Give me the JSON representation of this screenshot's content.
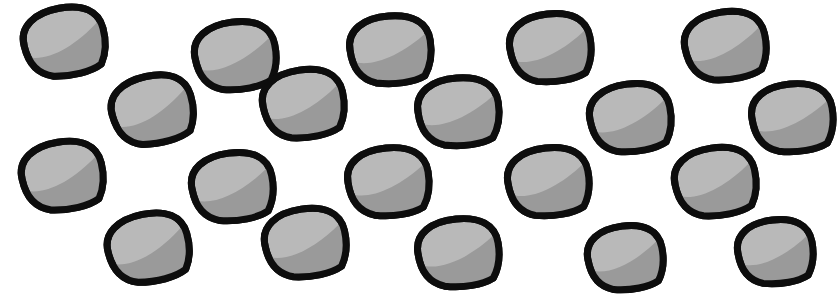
{
  "image": {
    "title": "Seed shapes pattern",
    "width": 837,
    "height": 302,
    "background_color": "#ffffff",
    "object_count": 20,
    "row_count": 4,
    "columns_per_row": 5,
    "arrangement": "staggered grid"
  },
  "shape_style": {
    "name": "seed",
    "outline_color": "#0d0d0d",
    "outline_width": 7,
    "fill_light": "#b9b9b9",
    "fill_shadow": "#9a9a9a",
    "description": "teardrop / seed with pointed lower-right tip, light gray body and darker gray crescent shading along the lower-right"
  },
  "chart_data": {
    "type": "scatter",
    "xlabel": "",
    "ylabel": "",
    "xlim": [
      0,
      837
    ],
    "ylim": [
      0,
      302
    ],
    "grid": false,
    "legend": null,
    "series": [
      {
        "name": "seeds",
        "marker": "seed",
        "points": [
          {
            "id": "seed-r1-c1",
            "row": 1,
            "col": 1,
            "x": 64,
            "y": 42,
            "rx": 41,
            "ry": 34,
            "rotate": -12
          },
          {
            "id": "seed-r1-c2",
            "row": 1,
            "col": 2,
            "x": 235,
            "y": 56,
            "rx": 41,
            "ry": 34,
            "rotate": -9
          },
          {
            "id": "seed-r1-c3",
            "row": 1,
            "col": 3,
            "x": 390,
            "y": 50,
            "rx": 41,
            "ry": 34,
            "rotate": -6
          },
          {
            "id": "seed-r1-c4",
            "row": 1,
            "col": 4,
            "x": 550,
            "y": 48,
            "rx": 41,
            "ry": 34,
            "rotate": -8
          },
          {
            "id": "seed-r1-c5",
            "row": 1,
            "col": 5,
            "x": 725,
            "y": 46,
            "rx": 41,
            "ry": 34,
            "rotate": -10
          }
        ]
      },
      {
        "name": "seeds-row2",
        "marker": "seed",
        "points": [
          {
            "id": "seed-r2-c1",
            "row": 2,
            "col": 1,
            "x": 152,
            "y": 110,
            "rx": 41,
            "ry": 34,
            "rotate": -14
          },
          {
            "id": "seed-r2-c2",
            "row": 2,
            "col": 2,
            "x": 303,
            "y": 104,
            "rx": 41,
            "ry": 34,
            "rotate": -10
          },
          {
            "id": "seed-r2-c3",
            "row": 2,
            "col": 3,
            "x": 458,
            "y": 112,
            "rx": 41,
            "ry": 34,
            "rotate": -6
          },
          {
            "id": "seed-r2-c4",
            "row": 2,
            "col": 4,
            "x": 630,
            "y": 118,
            "rx": 41,
            "ry": 34,
            "rotate": -9
          },
          {
            "id": "seed-r2-c5",
            "row": 2,
            "col": 5,
            "x": 792,
            "y": 118,
            "rx": 41,
            "ry": 34,
            "rotate": -7
          }
        ]
      },
      {
        "name": "seeds-row3",
        "marker": "seed",
        "points": [
          {
            "id": "seed-r3-c1",
            "row": 3,
            "col": 1,
            "x": 62,
            "y": 176,
            "rx": 41,
            "ry": 34,
            "rotate": -11
          },
          {
            "id": "seed-r3-c2",
            "row": 3,
            "col": 2,
            "x": 232,
            "y": 187,
            "rx": 41,
            "ry": 34,
            "rotate": -9
          },
          {
            "id": "seed-r3-c3",
            "row": 3,
            "col": 3,
            "x": 388,
            "y": 182,
            "rx": 41,
            "ry": 34,
            "rotate": -7
          },
          {
            "id": "seed-r3-c4",
            "row": 3,
            "col": 4,
            "x": 548,
            "y": 182,
            "rx": 41,
            "ry": 34,
            "rotate": -8
          },
          {
            "id": "seed-r3-c5",
            "row": 3,
            "col": 5,
            "x": 715,
            "y": 182,
            "rx": 41,
            "ry": 34,
            "rotate": -10
          }
        ]
      },
      {
        "name": "seeds-row4",
        "marker": "seed",
        "points": [
          {
            "id": "seed-r4-c1",
            "row": 4,
            "col": 1,
            "x": 148,
            "y": 248,
            "rx": 41,
            "ry": 34,
            "rotate": -13
          },
          {
            "id": "seed-r4-c2",
            "row": 4,
            "col": 2,
            "x": 305,
            "y": 243,
            "rx": 41,
            "ry": 34,
            "rotate": -10
          },
          {
            "id": "seed-r4-c3",
            "row": 4,
            "col": 3,
            "x": 458,
            "y": 253,
            "rx": 41,
            "ry": 34,
            "rotate": -7
          },
          {
            "id": "seed-r4-c4",
            "row": 4,
            "col": 4,
            "x": 625,
            "y": 258,
            "rx": 38,
            "ry": 32,
            "rotate": -9
          },
          {
            "id": "seed-r4-c5",
            "row": 4,
            "col": 5,
            "x": 775,
            "y": 252,
            "rx": 38,
            "ry": 32,
            "rotate": -8
          }
        ]
      }
    ]
  }
}
